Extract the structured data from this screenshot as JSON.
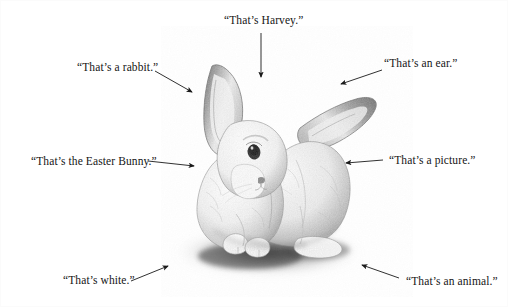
{
  "figure": {
    "width": 508,
    "height": 307,
    "background_color": "#ffffff",
    "ink_color": "#151515",
    "medium": "graphite pencil illustration",
    "caption_style": "quoted ostensive-definition labels with arrows pointing to the rabbit"
  },
  "labels": [
    {
      "id": "harvey",
      "text": "“That’s Harvey.”",
      "name": "label-thats-harvey",
      "x": 224,
      "y": 14,
      "arrow": {
        "x1": 261,
        "y1": 33,
        "x2": 261,
        "y2": 77
      }
    },
    {
      "id": "rabbit",
      "text": "“That’s a rabbit.”",
      "name": "label-thats-a-rabbit",
      "x": 77,
      "y": 61,
      "arrow": {
        "x1": 155,
        "y1": 71,
        "x2": 192,
        "y2": 92
      }
    },
    {
      "id": "ear",
      "text": "“That’s an ear.”",
      "name": "label-thats-an-ear",
      "x": 384,
      "y": 57,
      "arrow": {
        "x1": 382,
        "y1": 70,
        "x2": 341,
        "y2": 84
      }
    },
    {
      "id": "easter-bunny",
      "text": "“That’s the Easter Bunny.”",
      "name": "label-thats-the-easter-bunny",
      "x": 31,
      "y": 155,
      "arrow": {
        "x1": 148,
        "y1": 161,
        "x2": 194,
        "y2": 166
      }
    },
    {
      "id": "picture",
      "text": "“That’s a picture.”",
      "name": "label-thats-a-picture",
      "x": 389,
      "y": 154,
      "arrow": {
        "x1": 383,
        "y1": 160,
        "x2": 346,
        "y2": 163
      }
    },
    {
      "id": "white",
      "text": "“That’s white.”",
      "name": "label-thats-white",
      "x": 63,
      "y": 274,
      "arrow": {
        "x1": 131,
        "y1": 281,
        "x2": 168,
        "y2": 266
      }
    },
    {
      "id": "animal",
      "text": "“That’s an animal.”",
      "name": "label-thats-an-animal",
      "x": 406,
      "y": 275,
      "arrow": {
        "x1": 399,
        "y1": 278,
        "x2": 362,
        "y2": 265
      }
    }
  ]
}
